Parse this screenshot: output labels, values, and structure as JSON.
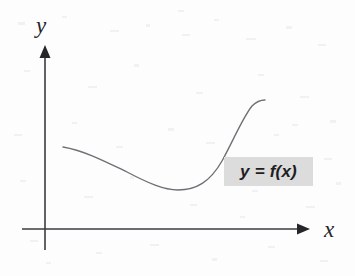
{
  "figure": {
    "kind": "line",
    "background_color": "#fdfdfd",
    "ink_color": "#3a3a40",
    "curve_color": "#6e6e74",
    "label_color": "#25252a",
    "highlight_color": "#dcdcdc",
    "axes": {
      "y": {
        "label": "y",
        "icon": "up-arrow-axis",
        "x_px": 45,
        "top_px": 45,
        "bottom_px": 250
      },
      "x": {
        "label": "x",
        "icon": "right-arrow-axis",
        "y_px": 229,
        "left_px": 22,
        "right_px": 310
      },
      "origin_px": [
        45,
        229
      ]
    },
    "annotations": [
      {
        "name": "function-equation",
        "text": "y = f(x)",
        "highlighted": true,
        "box_px": [
          224,
          157,
          89,
          29
        ]
      }
    ]
  },
  "chart_data": {
    "type": "line",
    "title": "",
    "xlabel": "x",
    "ylabel": "y",
    "grid": false,
    "legend": null,
    "series": [
      {
        "name": "y = f(x)",
        "description": "Smooth curve: starts high on the left, decreases to a local minimum, then increases steeply and levels off.",
        "points_px": [
          [
            63,
            147
          ],
          [
            80,
            150
          ],
          [
            100,
            157
          ],
          [
            120,
            167
          ],
          [
            140,
            178
          ],
          [
            158,
            186
          ],
          [
            170,
            189
          ],
          [
            178,
            190
          ],
          [
            190,
            189
          ],
          [
            202,
            184
          ],
          [
            213,
            174
          ],
          [
            224,
            157
          ],
          [
            234,
            136
          ],
          [
            243,
            118
          ],
          [
            251,
            107
          ],
          [
            258,
            102
          ],
          [
            265,
            100
          ]
        ],
        "path_d": "M 63 147 C 86 151 108 163 127 172 C 148 183 164 190 178 190 C 196 190 210 182 222 161 C 234 139 243 117 252 106 C 257 101 261 100 265 100"
      }
    ],
    "annotations": [
      {
        "text": "y = f(x)",
        "x_px": 268,
        "y_px": 172
      }
    ]
  }
}
